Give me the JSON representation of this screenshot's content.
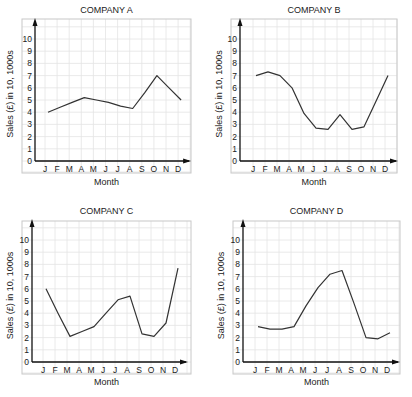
{
  "chart_data": [
    {
      "type": "line",
      "title": "COMPANY A",
      "xlabel": "Month",
      "ylabel": "Sales (£) in 10, 1000s",
      "categories": [
        "J",
        "F",
        "M",
        "A",
        "M",
        "J",
        "J",
        "A",
        "S",
        "O",
        "N",
        "D"
      ],
      "values": [
        4.0,
        4.4,
        4.8,
        5.2,
        5.0,
        4.8,
        4.5,
        4.3,
        5.6,
        7.0,
        6.0,
        5.0
      ],
      "yticks": [
        0,
        1,
        2,
        3,
        4,
        5,
        6,
        7,
        8,
        9,
        10
      ],
      "ylim": [
        0,
        10
      ],
      "grid": true
    },
    {
      "type": "line",
      "title": "COMPANY B",
      "xlabel": "Month",
      "ylabel": "Sales (£) in 10, 1000s",
      "categories": [
        "J",
        "F",
        "M",
        "A",
        "M",
        "J",
        "J",
        "A",
        "S",
        "O",
        "N",
        "D"
      ],
      "values": [
        7.0,
        7.3,
        7.0,
        6.0,
        3.9,
        2.7,
        2.6,
        3.8,
        2.6,
        2.8,
        4.9,
        7.0
      ],
      "yticks": [
        0,
        1,
        2,
        3,
        4,
        5,
        6,
        7,
        8,
        9,
        10
      ],
      "ylim": [
        0,
        10
      ],
      "grid": true
    },
    {
      "type": "line",
      "title": "COMPANY C",
      "xlabel": "Month",
      "ylabel": "Sales (£) in 10, 1000s",
      "categories": [
        "J",
        "F",
        "M",
        "A",
        "M",
        "J",
        "J",
        "A",
        "S",
        "O",
        "N",
        "D"
      ],
      "values": [
        6.0,
        4.0,
        2.1,
        2.5,
        2.9,
        4.0,
        5.1,
        5.4,
        2.3,
        2.1,
        3.2,
        7.7
      ],
      "yticks": [
        0,
        1,
        2,
        3,
        4,
        5,
        6,
        7,
        8,
        9,
        10
      ],
      "ylim": [
        0,
        10
      ],
      "grid": true
    },
    {
      "type": "line",
      "title": "COMPANY D",
      "xlabel": "Month",
      "ylabel": "Sales (£) in 10, 1000s",
      "categories": [
        "J",
        "F",
        "M",
        "A",
        "M",
        "J",
        "J",
        "A",
        "S",
        "O",
        "N",
        "D"
      ],
      "values": [
        2.9,
        2.7,
        2.7,
        2.9,
        4.6,
        6.1,
        7.2,
        7.5,
        4.8,
        2.0,
        1.9,
        2.4
      ],
      "yticks": [
        0,
        1,
        2,
        3,
        4,
        5,
        6,
        7,
        8,
        9,
        10
      ],
      "ylim": [
        0,
        10
      ],
      "grid": true
    }
  ],
  "layout": [
    {
      "frame": [
        22,
        19,
        191,
        173
      ],
      "origin": [
        35,
        161
      ],
      "xstep": 12.1,
      "x0": 45,
      "ystep": 12.2,
      "titleY": 13,
      "monthY": 185
    },
    {
      "frame": [
        231,
        19,
        397,
        173
      ],
      "origin": [
        240,
        161
      ],
      "xstep": 12.0,
      "x0": 253,
      "ystep": 12.2,
      "titleY": 13,
      "monthY": 185
    },
    {
      "frame": [
        22,
        221,
        191,
        374
      ],
      "origin": [
        32,
        362
      ],
      "xstep": 12.0,
      "x0": 43,
      "ystep": 12.2,
      "titleY": 214,
      "monthY": 385
    },
    {
      "frame": [
        233,
        221,
        400,
        374
      ],
      "origin": [
        243,
        362
      ],
      "xstep": 12.0,
      "x0": 255,
      "ystep": 12.2,
      "titleY": 214,
      "monthY": 385
    }
  ]
}
